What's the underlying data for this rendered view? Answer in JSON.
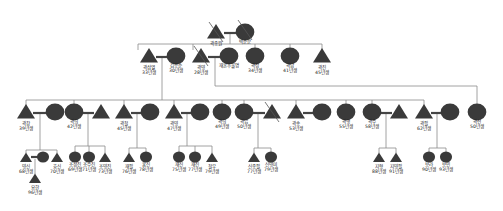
{
  "diagram": {
    "type": "genogram",
    "colors": {
      "shape_fill": "#3a3a3a",
      "line": "#888888",
      "bond": "#444444",
      "text": "#222222"
    },
    "generations": [
      {
        "level": 1,
        "nodes": [
          {
            "id": "g1m",
            "shape": "triangle",
            "deceased": true,
            "name": "곽종원",
            "age": "",
            "x": 216,
            "y": 34
          },
          {
            "id": "g1f",
            "shape": "circle",
            "deceased": true,
            "name": "박순분",
            "age": "",
            "x": 245,
            "y": 32
          }
        ]
      },
      {
        "level": 2,
        "nodes": [
          {
            "id": "g2a",
            "shape": "triangle",
            "name": "곽삼열",
            "age": "33년생",
            "x": 149,
            "y": 58
          },
          {
            "id": "g2a_sp",
            "shape": "circle",
            "name": "김응순",
            "age": "30년생",
            "x": 176,
            "y": 56
          },
          {
            "id": "g2b",
            "shape": "triangle",
            "deceased": true,
            "name": "곽영",
            "age": "28년생",
            "x": 201,
            "y": 58
          },
          {
            "id": "g2b_sp",
            "shape": "circle",
            "name": "재혼후불명",
            "age": "",
            "x": 229,
            "y": 56
          },
          {
            "id": "g2c",
            "shape": "circle",
            "name": "곽정",
            "age": "34년생",
            "x": 255,
            "y": 56
          },
          {
            "id": "g2d",
            "shape": "circle",
            "name": "곽남",
            "age": "41년생",
            "x": 290,
            "y": 56
          },
          {
            "id": "g2e",
            "shape": "triangle",
            "name": "곽진",
            "age": "45년생",
            "x": 322,
            "y": 58
          }
        ]
      },
      {
        "level": 3,
        "nodes": [
          {
            "id": "g3a",
            "shape": "triangle",
            "name": "곽창",
            "age": "39년생",
            "x": 26,
            "y": 114
          },
          {
            "id": "g3a_sp",
            "shape": "circle",
            "name": "",
            "age": "",
            "x": 55,
            "y": 112
          },
          {
            "id": "g3b",
            "shape": "circle",
            "name": "곽희",
            "age": "42년생",
            "x": 74,
            "y": 112
          },
          {
            "id": "g3b_sp",
            "shape": "triangle",
            "name": "",
            "age": "",
            "x": 101,
            "y": 114
          },
          {
            "id": "g3c",
            "shape": "triangle",
            "name": "곽철",
            "age": "45년생",
            "x": 124,
            "y": 114
          },
          {
            "id": "g3c_sp",
            "shape": "circle",
            "name": "",
            "age": "",
            "x": 150,
            "y": 112
          },
          {
            "id": "g3d",
            "shape": "triangle",
            "name": "곽영",
            "age": "47년생",
            "x": 174,
            "y": 114
          },
          {
            "id": "g3d_sp",
            "shape": "circle",
            "name": "",
            "age": "",
            "x": 200,
            "y": 112
          },
          {
            "id": "g3e",
            "shape": "circle",
            "name": "곽희",
            "age": "49년생",
            "x": 222,
            "y": 112
          },
          {
            "id": "g3f",
            "shape": "circle",
            "name": "곽임",
            "age": "50년생",
            "x": 244,
            "y": 112
          },
          {
            "id": "g3f_sp",
            "shape": "triangle",
            "deceased": true,
            "name": "",
            "age": "",
            "x": 272,
            "y": 114
          },
          {
            "id": "g3g",
            "shape": "triangle",
            "name": "곽송",
            "age": "53년생",
            "x": 296,
            "y": 114
          },
          {
            "id": "g3g_sp",
            "shape": "circle",
            "name": "",
            "age": "",
            "x": 322,
            "y": 112
          },
          {
            "id": "g3h",
            "shape": "circle",
            "name": "곽행",
            "age": "55년생",
            "x": 346,
            "y": 112
          },
          {
            "id": "g3i",
            "shape": "circle",
            "name": "곽주",
            "age": "58년생",
            "x": 372,
            "y": 112
          },
          {
            "id": "g3i_sp",
            "shape": "triangle",
            "name": "",
            "age": "",
            "x": 399,
            "y": 114
          },
          {
            "id": "g3j",
            "shape": "triangle",
            "name": "곽필",
            "age": "62년생",
            "x": 424,
            "y": 114
          },
          {
            "id": "g3j_sp",
            "shape": "circle",
            "name": "",
            "age": "",
            "x": 450,
            "y": 112
          },
          {
            "id": "g3k",
            "shape": "circle",
            "name": "곽선",
            "age": "50년생",
            "x": 477,
            "y": 112
          }
        ]
      },
      {
        "level": 4,
        "nodes": [
          {
            "id": "g4a1",
            "shape": "triangle",
            "name": "영신",
            "age": "68년생",
            "x": 26,
            "y": 159
          },
          {
            "id": "g4a1_sp",
            "shape": "circle",
            "name": "",
            "age": "",
            "x": 43,
            "y": 157
          },
          {
            "id": "g4a2",
            "shape": "triangle",
            "name": "효신",
            "age": "70년생",
            "x": 57,
            "y": 159
          },
          {
            "id": "g4b1",
            "shape": "circle",
            "name": "조성진",
            "age": "69년생",
            "x": 75,
            "y": 157
          },
          {
            "id": "g4b2",
            "shape": "circle",
            "name": "조수진",
            "age": "71년생",
            "x": 89,
            "y": 157
          },
          {
            "id": "g4b3",
            "shape": "triangle",
            "name": "조영진",
            "age": "73년생",
            "x": 105,
            "y": 159
          },
          {
            "id": "g4c1",
            "shape": "triangle",
            "name": "재필",
            "age": "76년생",
            "x": 129,
            "y": 159
          },
          {
            "id": "g4c2",
            "shape": "circle",
            "name": "홍신",
            "age": "78년생",
            "x": 146,
            "y": 157
          },
          {
            "id": "g4d1",
            "shape": "circle",
            "name": "재신",
            "age": "75년생",
            "x": 179,
            "y": 157
          },
          {
            "id": "g4d2",
            "shape": "circle",
            "name": "재진",
            "age": "77년생",
            "x": 195,
            "y": 157
          },
          {
            "id": "g4d3",
            "shape": "triangle",
            "name": "철우",
            "age": "79년생",
            "x": 212,
            "y": 159
          },
          {
            "id": "g4f1",
            "shape": "triangle",
            "name": "신종필",
            "age": "77년생",
            "x": 254,
            "y": 159
          },
          {
            "id": "g4f2",
            "shape": "circle",
            "name": "신영미",
            "age": "79년생",
            "x": 271,
            "y": 157
          },
          {
            "id": "g4i1",
            "shape": "triangle",
            "name": "지형",
            "age": "88년생",
            "x": 379,
            "y": 159
          },
          {
            "id": "g4i2",
            "shape": "triangle",
            "name": "지영필",
            "age": "91년생",
            "x": 396,
            "y": 159
          },
          {
            "id": "g4j1",
            "shape": "circle",
            "name": "보라",
            "age": "90년생",
            "x": 429,
            "y": 157
          },
          {
            "id": "g4j2",
            "shape": "circle",
            "name": "보민",
            "age": "93년생",
            "x": 446,
            "y": 157
          }
        ]
      },
      {
        "level": 5,
        "nodes": [
          {
            "id": "g5a",
            "shape": "triangle",
            "name": "요한",
            "age": "96년생",
            "x": 35,
            "y": 180
          }
        ]
      }
    ],
    "labels": {
      "g1m": "곽종원",
      "g1f": "박순분"
    }
  }
}
